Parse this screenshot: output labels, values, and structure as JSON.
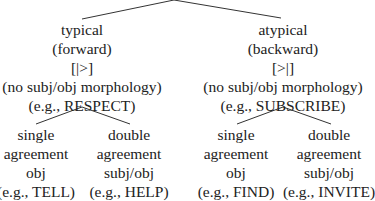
{
  "tree": {
    "branches": [
      {
        "lines": [
          "typical",
          "(forward)",
          "[|>]",
          "(no subj/obj morphology)",
          "(e.g., RESPECT)"
        ],
        "children": [
          {
            "lines": [
              "single",
              "agreement",
              "obj",
              "(e.g., TELL)"
            ]
          },
          {
            "lines": [
              "double",
              "agreement",
              "subj/obj",
              "(e.g., HELP)"
            ]
          }
        ]
      },
      {
        "lines": [
          "atypical",
          "(backward)",
          "[>|]",
          "(no subj/obj morphology)",
          "(e.g., SUBSCRIBE)"
        ],
        "children": [
          {
            "lines": [
              "single",
              "agreement",
              "obj",
              "(e.g., FIND)"
            ]
          },
          {
            "lines": [
              "double",
              "agreement",
              "subj/obj",
              "(e.g., INVITE)"
            ]
          }
        ]
      }
    ]
  },
  "colors": {
    "text": "#222222",
    "lines": "#333333",
    "background": "#ffffff"
  }
}
